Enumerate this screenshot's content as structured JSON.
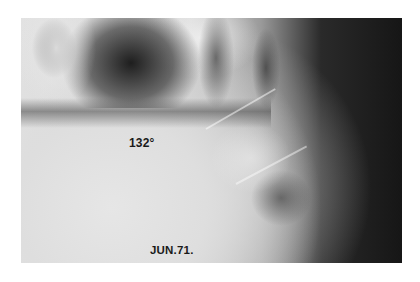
{
  "image": {
    "description": "Lateral lumbosacral radiograph",
    "annotations": {
      "angle": "132°",
      "date": "JUN.71."
    }
  }
}
